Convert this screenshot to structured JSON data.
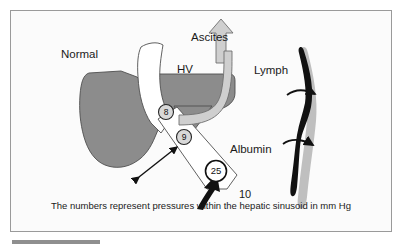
{
  "figure": {
    "title_labels": {
      "normal": "Normal",
      "ascites": "Ascites",
      "hv": "HV",
      "lymph": "Lymph",
      "albumin": "Albumin",
      "portal_pressure": "10"
    },
    "caption": "The numbers represent pressures within the hepatic sinusoid in mm Hg",
    "pressures": [
      {
        "id": "hepatic-vein",
        "value": "8"
      },
      {
        "id": "sinusoid-mid",
        "value": "9"
      },
      {
        "id": "portal-inflow",
        "value": "25"
      }
    ],
    "colors": {
      "liver_gray": "#8c8c8c",
      "vessel_black": "#111111",
      "shadow_gray": "#a8a8a8",
      "lymph_arrow": "#cfcfcf",
      "frame": "#9a9a9a",
      "background": "#fbfbfb",
      "text": "#1a1a1a"
    },
    "shapes": [
      {
        "name": "liver-parenchyma",
        "kind": "filled-blob",
        "color": "#8c8c8c"
      },
      {
        "name": "hepatic-vein-body",
        "kind": "filled-blob",
        "color": "#8c8c8c"
      },
      {
        "name": "hepatic-vein-wedge",
        "kind": "triangle",
        "color": "#8c8c8c"
      },
      {
        "name": "sinusoid-channel",
        "kind": "white-band",
        "color": "#ffffff"
      },
      {
        "name": "lymph-arrow",
        "kind": "curved-block-arrow",
        "color": "#cfcfcf"
      },
      {
        "name": "ascites-arrow",
        "kind": "block-arrow-up",
        "color": "#cfcfcf"
      },
      {
        "name": "albumin-arrow",
        "kind": "double-headed-arrow",
        "color": "#111111"
      },
      {
        "name": "portal-inflow-arrow",
        "kind": "thick-arrow-up",
        "color": "#111111"
      },
      {
        "name": "sinusoid-vessel",
        "kind": "vertical-vessel",
        "color": "#111111"
      },
      {
        "name": "vessel-flow-arrow-upper",
        "kind": "curved-arrow-right",
        "color": "#111111"
      },
      {
        "name": "vessel-flow-arrow-lower",
        "kind": "curved-arrow-right",
        "color": "#111111"
      }
    ]
  }
}
